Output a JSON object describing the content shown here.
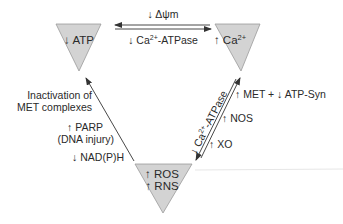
{
  "diagram": {
    "type": "cycle-triangle",
    "colors": {
      "node_fill": "#d3d3d3",
      "node_stroke": "#9a9a9a",
      "line": "#333333",
      "text": "#2a2a2a"
    },
    "nodes": [
      {
        "id": "atp",
        "label": "↓ ATP"
      },
      {
        "id": "ca",
        "label": "↑ Ca",
        "sup": "2+"
      },
      {
        "id": "ros_rns",
        "lines": [
          "↑ ROS",
          "↑ RNS"
        ]
      }
    ],
    "edges": {
      "top": {
        "from_to": [
          "ca",
          "atp"
        ],
        "bidirectional": true,
        "label_above": "↓ Δψm",
        "label_below": {
          "prefix": "↓ Ca",
          "sup": "2+",
          "suffix": "-ATPase"
        }
      },
      "right": {
        "from_to": [
          "ros_rns",
          "ca"
        ],
        "bidirectional": true,
        "rotated_label": {
          "prefix": "↓ Ca",
          "sup": "2+",
          "suffix": "-ATPase"
        },
        "side_labels": [
          "↑ MET + ↓ ATP-Syn",
          "↑ NOS",
          "↑ XO"
        ]
      },
      "left": {
        "from_to": [
          "ros_rns",
          "atp"
        ],
        "bidirectional": false,
        "side_labels": [
          "Inactivation of",
          "MET complexes",
          "↑ PARP",
          "(DNA injury)",
          "↓ NAD(P)H"
        ]
      }
    }
  }
}
